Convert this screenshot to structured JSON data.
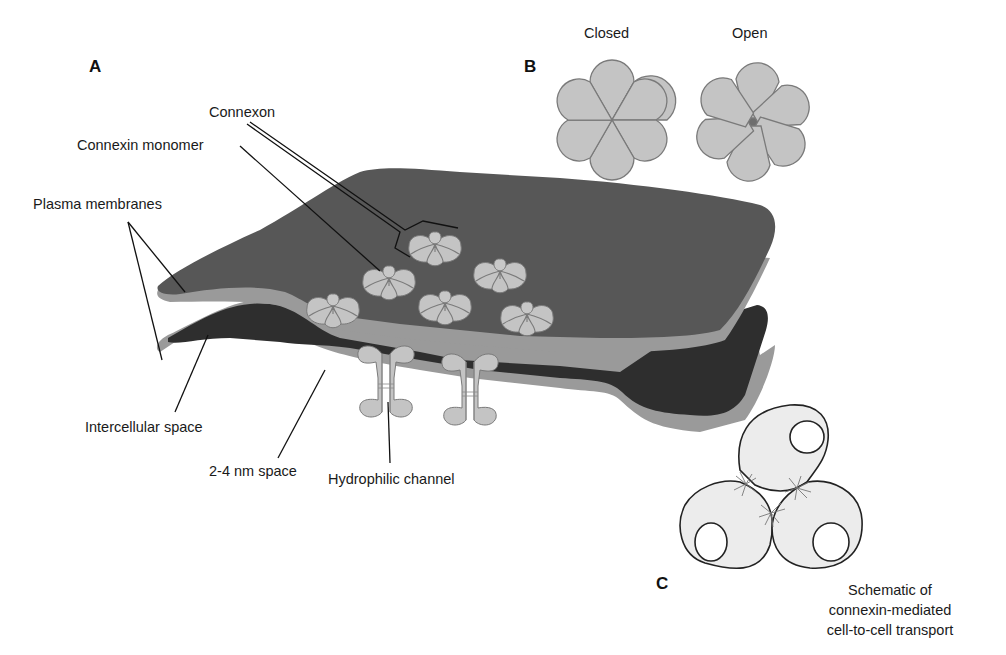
{
  "figure": {
    "panels": {
      "a": {
        "letter": "A"
      },
      "b": {
        "letter": "B",
        "states": {
          "closed": "Closed",
          "open": "Open"
        }
      },
      "c": {
        "letter": "C",
        "caption": [
          "Schematic of",
          "connexin-mediated",
          "cell-to-cell transport"
        ]
      }
    },
    "labels": {
      "connexon": "Connexon",
      "connexin_monomer": "Connexin monomer",
      "plasma_membranes": "Plasma membranes",
      "intercellular_space": "Intercellular space",
      "gap_space": "2-4 nm space",
      "hydrophilic_channel": "Hydrophilic channel"
    },
    "colors": {
      "membrane_top": "#575757",
      "membrane_edge": "#9a9a9a",
      "intercellular": "#2e2e2e",
      "connexin": "#c4c4c4",
      "connexin_outline": "#7a7a7a",
      "pore_open": "#6e6e6e",
      "cell_fill": "#ececec",
      "outline": "#222222"
    }
  }
}
